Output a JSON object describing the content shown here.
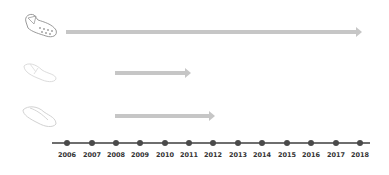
{
  "diagram": {
    "type": "timeline",
    "rows": [
      {
        "icon": "clog-shoe-icon",
        "start_year": 2006,
        "end_year": 2018
      },
      {
        "icon": "sandal-shoe-icon",
        "start_year": 2008,
        "end_year": 2011
      },
      {
        "icon": "flip-flop-shoe-icon",
        "start_year": 2008,
        "end_year": 2012
      }
    ],
    "years": [
      "2006",
      "2007",
      "2008",
      "2009",
      "2010",
      "2011",
      "2012",
      "2013",
      "2014",
      "2015",
      "2016",
      "2017",
      "2018"
    ]
  },
  "colors": {
    "arrow": "#c6c6c6",
    "axis_line": "#6e6e6e",
    "tick_dot": "#4a4a4a",
    "label": "#333333"
  }
}
